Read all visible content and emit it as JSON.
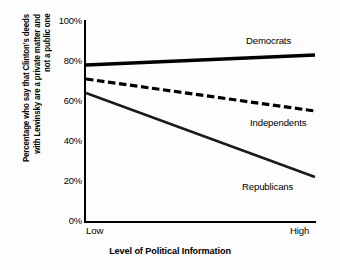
{
  "chart_data": {
    "type": "line",
    "title": "",
    "xlabel": "Level of Political Information",
    "ylabel": "Percentage who say that Clinton's deeds with Lewinsky are a private matter and not a public one",
    "ylabel_lines": [
      "Percentage who say that Clinton's deeds",
      "with Lewinsky are a private matter and",
      "not a public one"
    ],
    "x": [
      "Low",
      "High"
    ],
    "xticklabels": [
      "Low",
      "High"
    ],
    "yticklabels": [
      "100%",
      "80%",
      "60%",
      "40%",
      "20%",
      "0%"
    ],
    "ylim": [
      0,
      100
    ],
    "ytick_values": [
      100,
      80,
      60,
      40,
      20,
      0
    ],
    "grid": false,
    "legend_position": "inline-annotations",
    "series": [
      {
        "name": "Democrats",
        "values": [
          78,
          83
        ],
        "style": "solid",
        "linewidth": "thick",
        "color": "#000000"
      },
      {
        "name": "Independents",
        "values": [
          71,
          55
        ],
        "style": "dashed",
        "linewidth": "thick",
        "color": "#000000"
      },
      {
        "name": "Republicans",
        "values": [
          64,
          22
        ],
        "style": "solid",
        "linewidth": "medium",
        "color": "#1a1a1a"
      }
    ]
  },
  "figure": {
    "background_color": "#fdfdfd",
    "axis_color": "#000000"
  }
}
